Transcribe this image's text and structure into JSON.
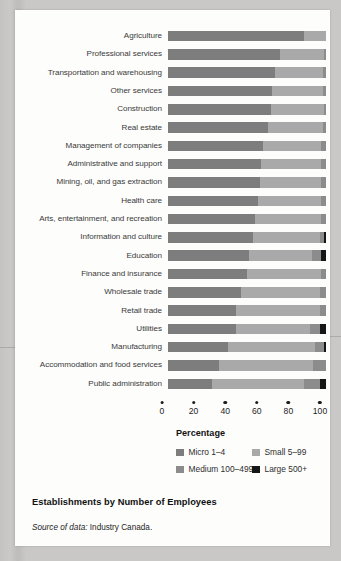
{
  "caption": "Establishments by Number of Employees",
  "source": {
    "prefix": "Source of data:",
    "rest": " Industry Canada."
  },
  "chart_data": {
    "type": "bar",
    "orientation": "horizontal",
    "stacked": true,
    "percent_stacked": true,
    "title": "Establishments by Number of Employees",
    "xlabel": "Percentage",
    "ylabel": "",
    "xlim": [
      0,
      100
    ],
    "xticks": [
      0,
      20,
      40,
      60,
      80,
      100
    ],
    "grid": false,
    "legend_position": "below-axis",
    "categories": [
      "Agriculture",
      "Professional services",
      "Transportation and warehousing",
      "Other services",
      "Construction",
      "Real estate",
      "Management of companies",
      "Administrative and support",
      "Mining, oil, and gas extraction",
      "Health care",
      "Arts, entertainment, and recreation",
      "Information and culture",
      "Education",
      "Finance and insurance",
      "Wholesale trade",
      "Retail trade",
      "Utilities",
      "Manufacturing",
      "Accommodation and food services",
      "Public administration"
    ],
    "series": [
      {
        "name": "Micro 1–4",
        "color": "#7d7d7d",
        "values": [
          86,
          71,
          68,
          66,
          65,
          63,
          60,
          59,
          58,
          57,
          55,
          54,
          51,
          50,
          46,
          43,
          43,
          38,
          32,
          28
        ]
      },
      {
        "name": "Small 5–99",
        "color": "#a9a9a9",
        "values": [
          14,
          28,
          30,
          32,
          34,
          35,
          37,
          38,
          39,
          40,
          42,
          42,
          40,
          47,
          50,
          53,
          47,
          55,
          60,
          58
        ]
      },
      {
        "name": "Medium 100–499",
        "color": "#8c8c8c",
        "values": [
          0,
          1,
          2,
          2,
          1,
          2,
          3,
          3,
          3,
          3,
          3,
          3,
          6,
          3,
          4,
          4,
          6,
          6,
          8,
          10
        ]
      },
      {
        "name": "Large 500+",
        "color": "#161616",
        "values": [
          0,
          0,
          0,
          0,
          0,
          0,
          0,
          0,
          0,
          0,
          0,
          1,
          3,
          0,
          0,
          0,
          4,
          1,
          0,
          4
        ]
      }
    ],
    "legend": [
      {
        "label": "Micro 1–4",
        "color": "#7d7d7d"
      },
      {
        "label": "Small 5–99",
        "color": "#a9a9a9"
      },
      {
        "label": "Medium 100–499",
        "color": "#8c8c8c"
      },
      {
        "label": "Large 500+",
        "color": "#161616"
      }
    ]
  }
}
